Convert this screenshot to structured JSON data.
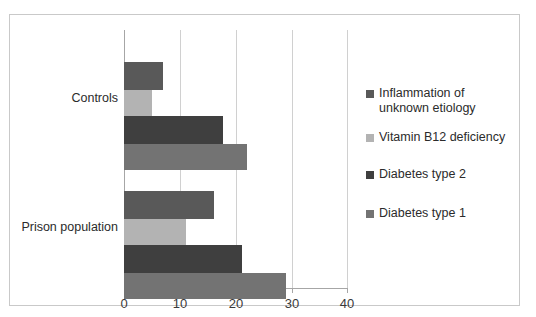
{
  "chart_data": {
    "type": "bar",
    "orientation": "horizontal",
    "title": "",
    "xlabel": "",
    "ylabel": "",
    "categories": [
      "Controls",
      "Prison population"
    ],
    "xticks": [
      "0",
      "10",
      "20",
      "30",
      "40"
    ],
    "xlim": [
      0,
      40
    ],
    "grid": true,
    "legend_position": "right",
    "series": [
      {
        "name": "Inflammation of unknown etiology",
        "color": "#595959",
        "values": [
          7,
          16
        ]
      },
      {
        "name": "Vitamin B12 deficiency",
        "color": "#b3b3b3",
        "values": [
          5,
          11
        ]
      },
      {
        "name": "Diabetes type 2",
        "color": "#3f3f3f",
        "values": [
          17.7,
          21
        ]
      },
      {
        "name": "Diabetes type 1",
        "color": "#737373",
        "values": [
          22,
          29
        ]
      }
    ],
    "legend_order": [
      "Inflammation of unknown etiology",
      "Vitamin B12 deficiency",
      "Diabetes type 2",
      "Diabetes type 1"
    ],
    "bar_order_within_group_top_to_bottom": [
      "Inflammation of unknown etiology",
      "Vitamin B12 deficiency",
      "Diabetes type 2",
      "Diabetes type 1"
    ]
  },
  "colors": {
    "frame_border": "#c9c9c9",
    "gridline": "#d0d0d0",
    "axis": "#a6a6a6",
    "tick_text": "#3a3a3a",
    "label_text": "#2b2b2b",
    "background": "#ffffff"
  }
}
